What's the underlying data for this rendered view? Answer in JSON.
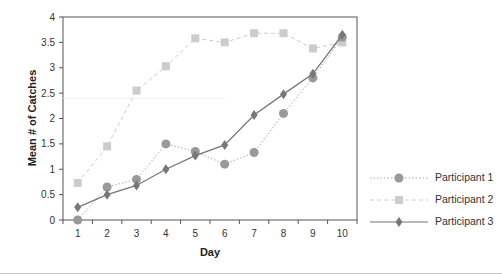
{
  "chart_data": {
    "type": "line",
    "title": "",
    "xlabel": "Day",
    "ylabel": "Mean # of Catches",
    "x": [
      1,
      2,
      3,
      4,
      5,
      6,
      7,
      8,
      9,
      10
    ],
    "x_tick_labels": [
      "1",
      "2",
      "3",
      "4",
      "5",
      "6",
      "7",
      "8",
      "9",
      "10"
    ],
    "ylim": [
      0,
      4
    ],
    "y_ticks": [
      0,
      0.5,
      1,
      1.5,
      2,
      2.5,
      3,
      3.5,
      4
    ],
    "y_tick_labels": [
      "0",
      "0.5",
      "1",
      "1.5",
      "2",
      "2.5",
      "3",
      "3.5",
      "4"
    ],
    "grid": false,
    "legend_position": "right",
    "series": [
      {
        "name": "Participant 1",
        "marker": "circle",
        "line_style": "dotted",
        "color": "#999999",
        "values": [
          0,
          0.65,
          0.8,
          1.5,
          1.35,
          1.1,
          1.33,
          2.1,
          2.8,
          3.6
        ]
      },
      {
        "name": "Participant 2",
        "marker": "square",
        "line_style": "dashed",
        "color": "#cccccc",
        "values": [
          0.73,
          1.45,
          2.55,
          3.03,
          3.58,
          3.5,
          3.68,
          3.68,
          3.38,
          3.5
        ]
      },
      {
        "name": "Participant 3",
        "marker": "diamond",
        "line_style": "solid",
        "color": "#777777",
        "values": [
          0.25,
          0.5,
          0.68,
          1.0,
          1.27,
          1.48,
          2.07,
          2.48,
          2.88,
          3.65
        ]
      }
    ]
  },
  "legend": {
    "items": [
      {
        "label": "Participant 1"
      },
      {
        "label": "Participant 2"
      },
      {
        "label": "Participant 3"
      }
    ]
  }
}
